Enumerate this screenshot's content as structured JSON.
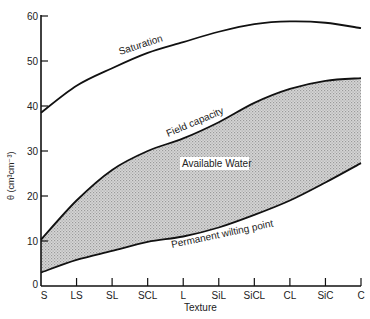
{
  "chart_data": {
    "type": "area",
    "title": "",
    "xlabel": "Texture",
    "ylabel": "θ (cm³cm⁻³)",
    "ylim": [
      0,
      60
    ],
    "yticks": [
      0,
      10,
      20,
      30,
      40,
      50,
      60
    ],
    "categories": [
      "S",
      "LS",
      "SL",
      "SCL",
      "L",
      "SiL",
      "SiCL",
      "CL",
      "SiC",
      "C"
    ],
    "series": [
      {
        "name": "Saturation",
        "values": [
          38.5,
          44.5,
          48.4,
          51.8,
          54.2,
          56.5,
          58.2,
          58.8,
          58.5,
          57.3
        ]
      },
      {
        "name": "Field capacity",
        "values": [
          10.3,
          19.0,
          25.8,
          30.0,
          32.8,
          36.4,
          40.7,
          43.8,
          45.6,
          46.2
        ]
      },
      {
        "name": "Permanent wilting point",
        "values": [
          3.0,
          5.8,
          7.8,
          9.8,
          11.0,
          13.0,
          15.8,
          19.0,
          23.0,
          27.3
        ]
      }
    ],
    "shaded_region": {
      "label": "Available Water",
      "between": [
        "Field capacity",
        "Permanent wilting point"
      ]
    },
    "annotations": [
      "Saturation",
      "Field capacity",
      "Available Water",
      "Permanent wilting point"
    ],
    "grid": false,
    "legend": "none (inline curve labels)"
  },
  "labels": {
    "saturation": "Saturation",
    "field_capacity": "Field capacity",
    "available_water": "Available Water",
    "pwp": "Permanent wilting point",
    "xlabel": "Texture",
    "ylabel": "θ (cm³cm⁻³)"
  }
}
